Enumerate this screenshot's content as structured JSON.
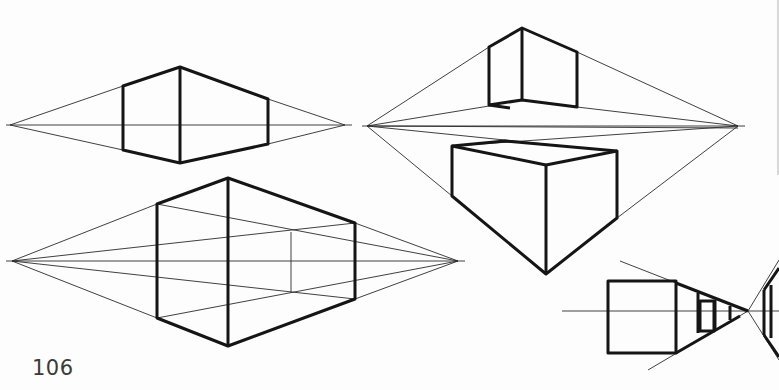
{
  "page": {
    "number": "106"
  },
  "figures": [
    {
      "id": "fig-top-left",
      "type": "two-point-box-at-eye-level",
      "vanishing_points": [
        [
          10,
          125
        ],
        [
          345,
          125
        ]
      ]
    },
    {
      "id": "fig-top-right",
      "type": "two-point-boxes-above-and-below-horizon",
      "vanishing_points": [
        [
          367,
          126
        ],
        [
          738,
          126
        ]
      ]
    },
    {
      "id": "fig-bottom-left",
      "type": "two-point-box-with-inner-construction",
      "vanishing_points": [
        [
          12,
          261
        ],
        [
          458,
          261
        ]
      ]
    },
    {
      "id": "fig-bottom-right",
      "type": "one-point-receding-boxes",
      "vanishing_points": [
        [
          748,
          311
        ]
      ]
    }
  ],
  "colors": {
    "ink": "#151515",
    "paper": "#fdfdfd",
    "page_number": "#3a3a3a"
  }
}
